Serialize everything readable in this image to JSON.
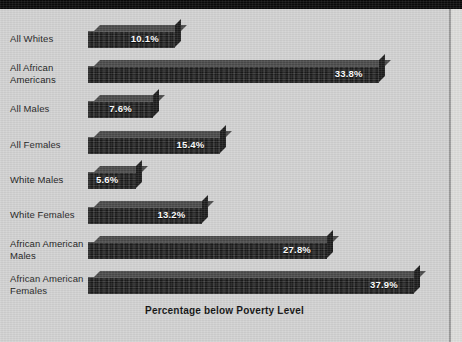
{
  "chart_data": {
    "type": "bar",
    "orientation": "horizontal",
    "title": "",
    "xlabel": "Percentage below Poverty Level",
    "ylabel": "",
    "xlim": [
      0,
      40
    ],
    "grid": false,
    "legend": null,
    "value_suffix": "%",
    "categories": [
      "All Whites",
      "All African Americans",
      "All Males",
      "All Females",
      "White Males",
      "White Females",
      "African American Males",
      "African American Females"
    ],
    "values": [
      10.1,
      33.8,
      7.6,
      15.4,
      5.6,
      13.2,
      27.8,
      37.9
    ],
    "data_labels": [
      "10.1%",
      "33.8%",
      "7.6%",
      "15.4%",
      "5.6%",
      "13.2%",
      "27.8%",
      "37.9%"
    ],
    "colors": {
      "background": "#d2d2d2",
      "bar_front": "#262626",
      "bar_top": "#4a4a4a",
      "bar_cap": "#1d1d1d",
      "label_text": "#1b1b1b",
      "value_text": "#ffffff",
      "top_band": "#0a0a0a"
    }
  },
  "rows": [
    {
      "label_line1": "All Whites",
      "label_line2": "",
      "value_label": "10.1%"
    },
    {
      "label_line1": "All African",
      "label_line2": "Americans",
      "value_label": "33.8%"
    },
    {
      "label_line1": "All Males",
      "label_line2": "",
      "value_label": "7.6%"
    },
    {
      "label_line1": "All Females",
      "label_line2": "",
      "value_label": "15.4%"
    },
    {
      "label_line1": "White Males",
      "label_line2": "",
      "value_label": "5.6%"
    },
    {
      "label_line1": "White Females",
      "label_line2": "",
      "value_label": "13.2%"
    },
    {
      "label_line1": "African American",
      "label_line2": "Males",
      "value_label": "27.8%"
    },
    {
      "label_line1": "African American",
      "label_line2": "Females",
      "value_label": "37.9%"
    }
  ],
  "axis": {
    "title": "Percentage below Poverty Level"
  }
}
